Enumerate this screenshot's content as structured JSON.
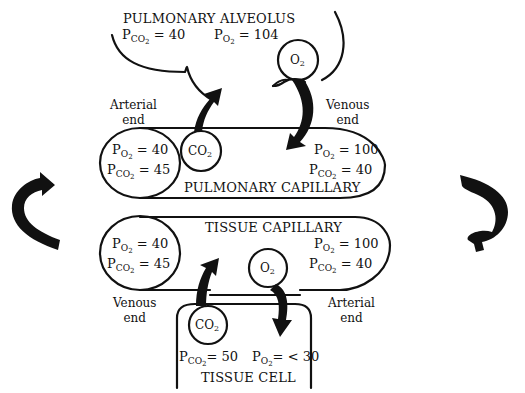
{
  "diagram": {
    "type": "gas-exchange-illustration",
    "colors": {
      "ink": "#111111",
      "background": "#ffffff"
    }
  },
  "alveolus": {
    "title": "PULMONARY ALVEOLUS",
    "pco2": {
      "symbol": "P",
      "sub": "CO",
      "subsub": "2",
      "value": "= 40"
    },
    "po2": {
      "symbol": "P",
      "sub": "O",
      "subsub": "2",
      "value": "= 104"
    },
    "gas_bubble": {
      "base": "O",
      "sub": "2"
    }
  },
  "pulmonary_capillary": {
    "title": "PULMONARY CAPILLARY",
    "left_end_label": [
      "Arterial",
      "end"
    ],
    "right_end_label": [
      "Venous",
      "end"
    ],
    "left_values": [
      {
        "symbol": "P",
        "sub": "O",
        "subsub": "2",
        "value": "= 40"
      },
      {
        "symbol": "P",
        "sub": "CO",
        "subsub": "2",
        "value": "= 45"
      }
    ],
    "right_values": [
      {
        "symbol": "P",
        "sub": "O",
        "subsub": "2",
        "value": "= 100"
      },
      {
        "symbol": "P",
        "sub": "CO",
        "subsub": "2",
        "value": "= 40"
      }
    ],
    "gas_bubble": {
      "base": "CO",
      "sub": "2"
    }
  },
  "tissue_capillary": {
    "title": "TISSUE CAPILLARY",
    "left_end_label": [
      "Venous",
      "end"
    ],
    "right_end_label": [
      "Arterial",
      "end"
    ],
    "left_values": [
      {
        "symbol": "P",
        "sub": "O",
        "subsub": "2",
        "value": "= 40"
      },
      {
        "symbol": "P",
        "sub": "CO",
        "subsub": "2",
        "value": "= 45"
      }
    ],
    "right_values": [
      {
        "symbol": "P",
        "sub": "O",
        "subsub": "2",
        "value": "= 100"
      },
      {
        "symbol": "P",
        "sub": "CO",
        "subsub": "2",
        "value": "= 40"
      }
    ],
    "gas_bubble": {
      "base": "O",
      "sub": "2"
    }
  },
  "tissue_cell": {
    "title": "TISSUE CELL",
    "pco2": {
      "symbol": "P",
      "sub": "CO",
      "subsub": "2",
      "value": "= 50"
    },
    "po2": {
      "symbol": "P",
      "sub": "O",
      "subsub": "2",
      "value": "= < 30"
    },
    "gas_bubble": {
      "base": "CO",
      "sub": "2"
    }
  },
  "circulation_arrows": {
    "left": "curved-arrow-up-right",
    "right": "curved-arrow-down-left"
  }
}
